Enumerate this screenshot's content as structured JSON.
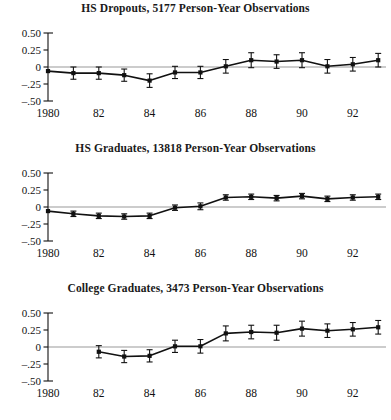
{
  "figure": {
    "panel_count": 3,
    "background": "#ffffff",
    "ink": "#111111",
    "zeroline_color": "#999999"
  },
  "axis": {
    "y_tick_labels": [
      "0.50",
      "0.25",
      "0",
      "–.25",
      "–.50"
    ],
    "y_tick_values": [
      0.5,
      0.25,
      0,
      -0.25,
      -0.5
    ],
    "x_tick_labels": [
      "1980",
      "82",
      "84",
      "86",
      "88",
      "90",
      "92"
    ],
    "x_tick_values": [
      1980,
      1982,
      1984,
      1986,
      1988,
      1990,
      1992
    ]
  },
  "chart_data": [
    {
      "type": "line",
      "title": "HS Dropouts, 5177 Person-Year Observations",
      "xlabel": "",
      "ylabel": "",
      "xlim": [
        1980,
        1993
      ],
      "ylim": [
        -0.5,
        0.5
      ],
      "grid": false,
      "legend": "none",
      "errorbars": true,
      "x": [
        1980,
        1981,
        1982,
        1983,
        1984,
        1985,
        1986,
        1987,
        1988,
        1989,
        1990,
        1991,
        1992,
        1993
      ],
      "values": [
        -0.06,
        -0.09,
        -0.09,
        -0.12,
        -0.2,
        -0.08,
        -0.08,
        0.01,
        0.1,
        0.08,
        0.1,
        0.01,
        0.04,
        0.1
      ],
      "err": [
        0.0,
        0.09,
        0.09,
        0.09,
        0.1,
        0.09,
        0.09,
        0.1,
        0.11,
        0.1,
        0.11,
        0.1,
        0.1,
        0.1
      ]
    },
    {
      "type": "line",
      "title": "HS Graduates, 13818 Person-Year Observations",
      "xlabel": "",
      "ylabel": "",
      "xlim": [
        1980,
        1993
      ],
      "ylim": [
        -0.5,
        0.5
      ],
      "grid": false,
      "legend": "none",
      "errorbars": true,
      "x": [
        1980,
        1981,
        1982,
        1983,
        1984,
        1985,
        1986,
        1987,
        1988,
        1989,
        1990,
        1991,
        1992,
        1993
      ],
      "values": [
        -0.06,
        -0.1,
        -0.13,
        -0.14,
        -0.13,
        -0.01,
        0.01,
        0.14,
        0.15,
        0.13,
        0.16,
        0.12,
        0.14,
        0.15
      ],
      "err": [
        0.0,
        0.04,
        0.04,
        0.04,
        0.04,
        0.04,
        0.05,
        0.04,
        0.04,
        0.04,
        0.04,
        0.04,
        0.04,
        0.04
      ]
    },
    {
      "type": "line",
      "title": "College Graduates, 3473 Person-Year Observations",
      "xlabel": "",
      "ylabel": "",
      "xlim": [
        1980,
        1993
      ],
      "ylim": [
        -0.5,
        0.5
      ],
      "grid": false,
      "legend": "none",
      "errorbars": true,
      "x": [
        1982,
        1983,
        1984,
        1985,
        1986,
        1987,
        1988,
        1989,
        1990,
        1991,
        1992,
        1993
      ],
      "values": [
        -0.07,
        -0.14,
        -0.13,
        0.01,
        0.01,
        0.2,
        0.22,
        0.21,
        0.27,
        0.24,
        0.26,
        0.29
      ],
      "err": [
        0.09,
        0.09,
        0.09,
        0.09,
        0.1,
        0.11,
        0.1,
        0.11,
        0.11,
        0.1,
        0.1,
        0.1
      ]
    }
  ]
}
